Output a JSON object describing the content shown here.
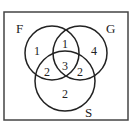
{
  "diagram": {
    "type": "venn",
    "sets": [
      {
        "name": "F",
        "label": "F"
      },
      {
        "name": "G",
        "label": "G"
      },
      {
        "name": "S",
        "label": "S"
      }
    ],
    "regions": {
      "F_only": "1",
      "F_and_G_only": "1",
      "G_only": "4",
      "F_and_S_only": "2",
      "F_G_S": "3",
      "G_and_S_only": "2",
      "S_only": "2"
    },
    "colors": {
      "stroke": "#222222",
      "background": "#ffffff"
    }
  }
}
